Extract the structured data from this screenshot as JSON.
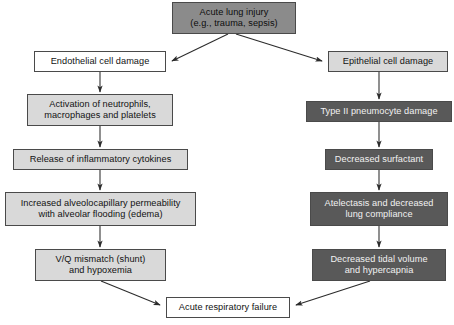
{
  "diagram": {
    "type": "flowchart",
    "orientation": "top-down, two parallel branches converging",
    "palette": {
      "white_fill": "#ffffff",
      "light_gray_fill": "#d9d9d9",
      "medium_gray_fill": "#8b8b8b",
      "dark_gray_fill": "#595959",
      "border": "#4a4a4a",
      "dark_text": "#121212",
      "light_text": "#f2f2f2",
      "arrow": "#2b2b2b",
      "background": "#ffffff"
    },
    "nodes": [
      {
        "id": "acute-lung-injury",
        "label": "Acute lung injury\n(e.g., trauma, sepsis)",
        "fill": "medium",
        "branch": "root",
        "x": 172,
        "y": 2,
        "w": 124,
        "h": 32
      },
      {
        "id": "endothelial-cell-damage",
        "label": "Endothelial cell damage",
        "fill": "white",
        "branch": "left",
        "x": 34,
        "y": 51,
        "w": 132,
        "h": 21
      },
      {
        "id": "activation-neutrophils",
        "label": "Activation of neutrophils,\nmacrophages and platelets",
        "fill": "light",
        "branch": "left",
        "x": 27,
        "y": 94,
        "w": 146,
        "h": 32
      },
      {
        "id": "release-cytokines",
        "label": "Release of inflammatory cytokines",
        "fill": "light",
        "branch": "left",
        "x": 13,
        "y": 149,
        "w": 175,
        "h": 21
      },
      {
        "id": "increased-permeability",
        "label": "Increased alveolocapillary permeability\nwith alveolar flooding (edema)",
        "fill": "light",
        "branch": "left",
        "x": 5,
        "y": 192,
        "w": 191,
        "h": 34
      },
      {
        "id": "vq-mismatch",
        "label": "V/Q mismatch (shunt)\nand hypoxemia",
        "fill": "light",
        "branch": "left",
        "x": 35,
        "y": 249,
        "w": 131,
        "h": 32
      },
      {
        "id": "epithelial-cell-damage",
        "label": "Epithelial cell damage",
        "fill": "light",
        "branch": "right",
        "x": 328,
        "y": 51,
        "w": 120,
        "h": 21
      },
      {
        "id": "type-ii-pneumocyte-damage",
        "label": "Type II pneumocyte damage",
        "fill": "dark",
        "branch": "right",
        "x": 306,
        "y": 101,
        "w": 146,
        "h": 21
      },
      {
        "id": "decreased-surfactant",
        "label": "Decreased surfactant",
        "fill": "dark",
        "branch": "right",
        "x": 325,
        "y": 149,
        "w": 108,
        "h": 21
      },
      {
        "id": "atelectasis",
        "label": "Atelectasis and decreased\nlung compliance",
        "fill": "dark",
        "branch": "right",
        "x": 310,
        "y": 192,
        "w": 138,
        "h": 34
      },
      {
        "id": "decreased-tidal-volume",
        "label": "Decreased tidal volume\nand hypercapnia",
        "fill": "dark",
        "branch": "right",
        "x": 312,
        "y": 249,
        "w": 134,
        "h": 32
      },
      {
        "id": "acute-respiratory-failure",
        "label": "Acute respiratory failure",
        "fill": "white",
        "branch": "terminal",
        "x": 166,
        "y": 297,
        "w": 124,
        "h": 21
      }
    ],
    "edges": [
      {
        "id": "edge-ali-to-endothelial",
        "from": "acute-lung-injury",
        "to": "endothelial-cell-damage",
        "shape": "diagonal"
      },
      {
        "id": "edge-ali-to-epithelial",
        "from": "acute-lung-injury",
        "to": "epithelial-cell-damage",
        "shape": "diagonal"
      },
      {
        "id": "edge-endothelial-to-activation",
        "from": "endothelial-cell-damage",
        "to": "activation-neutrophils",
        "shape": "vertical"
      },
      {
        "id": "edge-activation-to-cytokines",
        "from": "activation-neutrophils",
        "to": "release-cytokines",
        "shape": "vertical"
      },
      {
        "id": "edge-cytokines-to-permeability",
        "from": "release-cytokines",
        "to": "increased-permeability",
        "shape": "vertical"
      },
      {
        "id": "edge-permeability-to-vq",
        "from": "increased-permeability",
        "to": "vq-mismatch",
        "shape": "vertical"
      },
      {
        "id": "edge-vq-to-failure",
        "from": "vq-mismatch",
        "to": "acute-respiratory-failure",
        "shape": "diagonal"
      },
      {
        "id": "edge-epithelial-to-pneumocyte",
        "from": "epithelial-cell-damage",
        "to": "type-ii-pneumocyte-damage",
        "shape": "vertical"
      },
      {
        "id": "edge-pneumocyte-to-surfactant",
        "from": "type-ii-pneumocyte-damage",
        "to": "decreased-surfactant",
        "shape": "vertical"
      },
      {
        "id": "edge-surfactant-to-atelectasis",
        "from": "decreased-surfactant",
        "to": "atelectasis",
        "shape": "vertical"
      },
      {
        "id": "edge-atelectasis-to-tidal",
        "from": "atelectasis",
        "to": "decreased-tidal-volume",
        "shape": "vertical"
      },
      {
        "id": "edge-tidal-to-failure",
        "from": "decreased-tidal-volume",
        "to": "acute-respiratory-failure",
        "shape": "diagonal"
      }
    ]
  }
}
